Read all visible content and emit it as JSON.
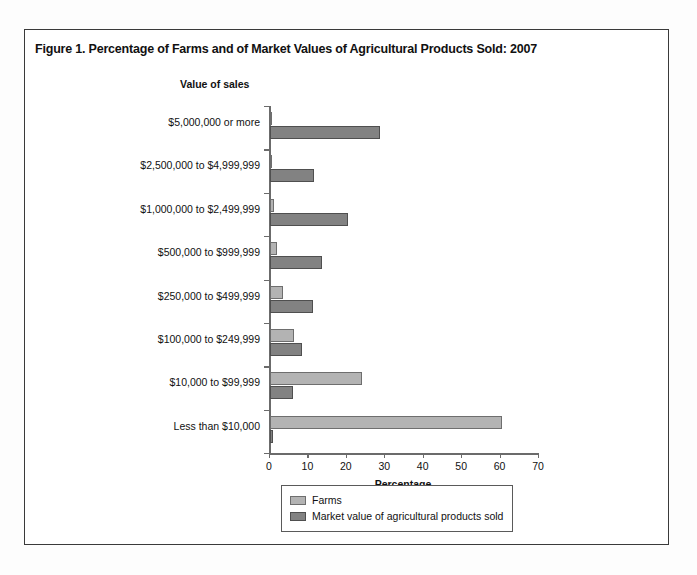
{
  "figure": {
    "title": "Figure 1. Percentage of Farms and of Market Values of Agricultural Products Sold:  2007",
    "value_of_sales_label": "Value of sales"
  },
  "legend": {
    "items": [
      {
        "key": "farms",
        "label": "Farms",
        "color": "#b3b3b3"
      },
      {
        "key": "market",
        "label": "Market value of agricultural products sold",
        "color": "#828282"
      }
    ]
  },
  "chart_data": {
    "type": "bar",
    "orientation": "horizontal",
    "title": "Figure 1. Percentage of Farms and of Market Values of Agricultural Products Sold:  2007",
    "xlabel": "Percentage",
    "ylabel": "Value of sales",
    "xlim": [
      0,
      70
    ],
    "xticks": [
      0,
      10,
      20,
      30,
      40,
      50,
      60,
      70
    ],
    "xtick_labels": [
      "0",
      "10",
      "20",
      "30",
      "40",
      "50",
      "60",
      "70"
    ],
    "grid": false,
    "legend_position": "bottom",
    "categories": [
      "$5,000,000 or more",
      "$2,500,000 to $4,999,999",
      "$1,000,000 to $2,499,999",
      "$500,000 to $999,999",
      "$250,000 to $499,999",
      "$100,000 to $249,999",
      "$10,000 to $99,999",
      "Less than $10,000"
    ],
    "series": [
      {
        "name": "Farms",
        "color": "#b3b3b3",
        "values": [
          0.4,
          0.3,
          1.1,
          1.8,
          3.4,
          6.2,
          24.0,
          60.5
        ]
      },
      {
        "name": "Market value of agricultural products sold",
        "color": "#828282",
        "values": [
          28.6,
          11.5,
          20.4,
          13.6,
          11.2,
          8.2,
          6.0,
          0.7
        ]
      }
    ]
  }
}
